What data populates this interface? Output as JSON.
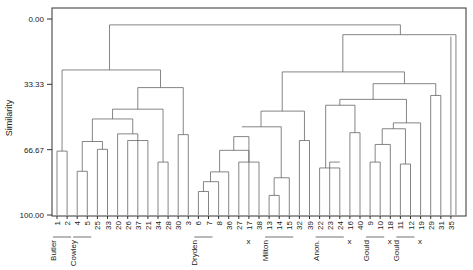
{
  "chart_data": {
    "type": "dendrogram",
    "title": "",
    "ylabel": "Similarity",
    "xlabel": "",
    "yticks": [
      "0.00",
      "33.33",
      "66.67",
      "100.00"
    ],
    "ylim": [
      0,
      100
    ],
    "leaves": [
      "1",
      "2",
      "4",
      "5",
      "25",
      "33",
      "20",
      "26",
      "37",
      "21",
      "34",
      "28",
      "30",
      "3",
      "6",
      "7",
      "8",
      "36",
      "27",
      "17",
      "38",
      "13",
      "14",
      "15",
      "32",
      "39",
      "22",
      "23",
      "24",
      "16",
      "40",
      "9",
      "10",
      "18",
      "11",
      "12",
      "19",
      "29",
      "31",
      "35"
    ],
    "leaf_markers": {
      "17": "x",
      "16": "x",
      "18": "x",
      "19": "x"
    },
    "groups": [
      {
        "label": "Butler",
        "from": "1",
        "to": "2"
      },
      {
        "label": "Cowley",
        "from": "4",
        "to": "5"
      },
      {
        "label": "Dryden",
        "from": "6",
        "to": "7"
      },
      {
        "label": "Milton",
        "from": "13",
        "to": "15"
      },
      {
        "label": "Anon.",
        "from": "22",
        "to": "24"
      },
      {
        "label": "Gould",
        "from": "9",
        "to": "10"
      },
      {
        "label": "Gould",
        "from": "11",
        "to": "12"
      }
    ],
    "merges": [
      {
        "x1": 7,
        "x2": 8,
        "y": 92
      },
      {
        "x1": 6,
        "x2": 7.5,
        "y": 86
      },
      {
        "x1": 6.75,
        "x2": 8,
        "y": 75
      },
      {
        "x1": 21,
        "x2": 22,
        "y": 91
      },
      {
        "x1": 21.5,
        "x2": 23,
        "y": 81
      }
    ]
  },
  "axis": {
    "ylabel": "Similarity"
  }
}
